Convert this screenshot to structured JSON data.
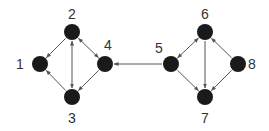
{
  "diagram": {
    "type": "directed-graph",
    "colors": {
      "node": "#1a1a1a",
      "edge": "#555555",
      "label": "#333333",
      "background": "#ffffff"
    },
    "nodes": [
      {
        "id": "1",
        "label": "1",
        "x": 40,
        "y": 64,
        "lx": 20,
        "ly": 69
      },
      {
        "id": "2",
        "label": "2",
        "x": 72,
        "y": 32,
        "lx": 72,
        "ly": 19
      },
      {
        "id": "3",
        "label": "3",
        "x": 72,
        "y": 97,
        "lx": 72,
        "ly": 123
      },
      {
        "id": "4",
        "label": "4",
        "x": 105,
        "y": 64,
        "lx": 108,
        "ly": 50
      },
      {
        "id": "5",
        "label": "5",
        "x": 171,
        "y": 64,
        "lx": 159,
        "ly": 53
      },
      {
        "id": "6",
        "label": "6",
        "x": 205,
        "y": 32,
        "lx": 205,
        "ly": 19
      },
      {
        "id": "7",
        "label": "7",
        "x": 205,
        "y": 97,
        "lx": 205,
        "ly": 123
      },
      {
        "id": "8",
        "label": "8",
        "x": 238,
        "y": 64,
        "lx": 252,
        "ly": 69
      }
    ],
    "edges": [
      {
        "from": "2",
        "to": "1",
        "bidirectional": false
      },
      {
        "from": "2",
        "to": "3",
        "bidirectional": true
      },
      {
        "from": "2",
        "to": "4",
        "bidirectional": true
      },
      {
        "from": "4",
        "to": "3",
        "bidirectional": false
      },
      {
        "from": "3",
        "to": "1",
        "bidirectional": false
      },
      {
        "from": "5",
        "to": "4",
        "bidirectional": false
      },
      {
        "from": "5",
        "to": "6",
        "bidirectional": true
      },
      {
        "from": "6",
        "to": "7",
        "bidirectional": false
      },
      {
        "from": "5",
        "to": "7",
        "bidirectional": false
      },
      {
        "from": "8",
        "to": "6",
        "bidirectional": false
      },
      {
        "from": "8",
        "to": "7",
        "bidirectional": false
      }
    ]
  }
}
